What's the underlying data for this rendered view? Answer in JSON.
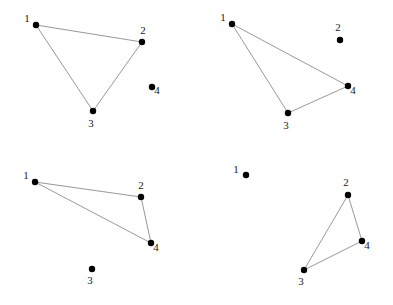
{
  "figure": {
    "title": "",
    "width": 393,
    "height": 305,
    "background_color": "#ffffff",
    "node_color": "#000000",
    "edge_color": "#8c8c8c",
    "label_color": "#1a1a1a",
    "node_radius": 3.2,
    "panels": [
      {
        "id": "panel-top-left",
        "position": "top-left",
        "nodes": [
          {
            "label": "1",
            "x": 36,
            "y": 25,
            "label_dx": -9,
            "label_dy": -3
          },
          {
            "label": "2",
            "x": 142,
            "y": 42,
            "label_dx": 1,
            "label_dy": -8
          },
          {
            "label": "3",
            "x": 93,
            "y": 111,
            "label_dx": -2,
            "label_dy": 16
          },
          {
            "label": "4",
            "x": 152,
            "y": 87,
            "label_dx": 5,
            "label_dy": 7
          }
        ],
        "edges": [
          {
            "from": "1",
            "to": "2"
          },
          {
            "from": "1",
            "to": "3"
          },
          {
            "from": "2",
            "to": "3"
          }
        ],
        "isolated_node": "4"
      },
      {
        "id": "panel-top-right",
        "position": "top-right",
        "nodes": [
          {
            "label": "1",
            "x": 232,
            "y": 24,
            "label_dx": -9,
            "label_dy": -3
          },
          {
            "label": "2",
            "x": 340,
            "y": 40,
            "label_dx": -2,
            "label_dy": -9
          },
          {
            "label": "3",
            "x": 288,
            "y": 113,
            "label_dx": -2,
            "label_dy": 16
          },
          {
            "label": "4",
            "x": 348,
            "y": 86,
            "label_dx": 5,
            "label_dy": 8
          }
        ],
        "edges": [
          {
            "from": "1",
            "to": "3"
          },
          {
            "from": "1",
            "to": "4"
          },
          {
            "from": "3",
            "to": "4"
          }
        ],
        "isolated_node": "2"
      },
      {
        "id": "panel-bottom-left",
        "position": "bottom-left",
        "nodes": [
          {
            "label": "1",
            "x": 35,
            "y": 182,
            "label_dx": -9,
            "label_dy": -3
          },
          {
            "label": "2",
            "x": 141,
            "y": 197,
            "label_dx": 0,
            "label_dy": -8
          },
          {
            "label": "3",
            "x": 92,
            "y": 269,
            "label_dx": -2,
            "label_dy": 15
          },
          {
            "label": "4",
            "x": 151,
            "y": 243,
            "label_dx": 5,
            "label_dy": 8
          }
        ],
        "edges": [
          {
            "from": "1",
            "to": "2"
          },
          {
            "from": "1",
            "to": "4"
          },
          {
            "from": "2",
            "to": "4"
          }
        ],
        "isolated_node": "3"
      },
      {
        "id": "panel-bottom-right",
        "position": "bottom-right",
        "nodes": [
          {
            "label": "1",
            "x": 246,
            "y": 175,
            "label_dx": -10,
            "label_dy": -2
          },
          {
            "label": "2",
            "x": 348,
            "y": 195,
            "label_dx": -2,
            "label_dy": -9
          },
          {
            "label": "3",
            "x": 304,
            "y": 270,
            "label_dx": -3,
            "label_dy": 15
          },
          {
            "label": "4",
            "x": 362,
            "y": 241,
            "label_dx": 5,
            "label_dy": 8
          }
        ],
        "edges": [
          {
            "from": "2",
            "to": "3"
          },
          {
            "from": "2",
            "to": "4"
          },
          {
            "from": "3",
            "to": "4"
          }
        ],
        "isolated_node": "1"
      }
    ]
  }
}
